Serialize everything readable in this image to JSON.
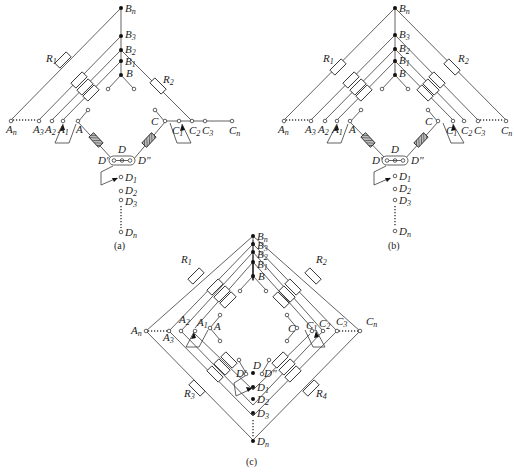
{
  "diagram": {
    "panels": [
      {
        "id": "a",
        "caption": "(a)",
        "top_nodes": [
          "Bn",
          "B3",
          "B2",
          "B1",
          "B"
        ],
        "left_terminals": [
          "An",
          "A3",
          "A2",
          "A1",
          "A"
        ],
        "right_terminals": [
          "C",
          "C1",
          "C2",
          "C3",
          "Cn"
        ],
        "bottom_terminals": [
          "D1",
          "D2",
          "D3",
          "Dn"
        ],
        "resistors": [
          "R1",
          "R2"
        ],
        "selector_labels": {
          "center": "D",
          "left": "D'",
          "right": "D\""
        }
      },
      {
        "id": "b",
        "caption": "(b)",
        "top_nodes": [
          "Bn",
          "B3",
          "B2",
          "B1",
          "B"
        ],
        "left_terminals": [
          "An",
          "A3",
          "A2",
          "A1",
          "A"
        ],
        "right_terminals": [
          "C",
          "C1",
          "C2",
          "C3",
          "Cn"
        ],
        "bottom_terminals": [
          "D1",
          "D2",
          "D3",
          "Dn"
        ],
        "resistors": [
          "R1",
          "R2"
        ],
        "selector_labels": {
          "center": "D",
          "left": "D'",
          "right": "D\""
        }
      },
      {
        "id": "c",
        "caption": "(c)",
        "top_nodes": [
          "Bn",
          "B3",
          "B2",
          "B1",
          "B"
        ],
        "left_terminals": [
          "An",
          "A3",
          "A2",
          "A1",
          "A"
        ],
        "right_terminals": [
          "C",
          "C1",
          "C2",
          "C3",
          "Cn"
        ],
        "bottom_nodes": [
          "D",
          "D1",
          "D2",
          "D3",
          "Dn"
        ],
        "resistors": [
          "R1",
          "R2",
          "R3",
          "R4"
        ],
        "selector_labels": {
          "center": "D",
          "left": "D'",
          "right": "D\""
        }
      }
    ],
    "labels": {
      "Bn": "B",
      "Bn_sub": "n",
      "B3": "B",
      "B3_sub": "3",
      "B2": "B",
      "B2_sub": "2",
      "B1": "B",
      "B1_sub": "1",
      "B": "B",
      "An": "A",
      "An_sub": "n",
      "A3": "A",
      "A3_sub": "3",
      "A2": "A",
      "A2_sub": "2",
      "A1": "A",
      "A1_sub": "1",
      "A": "A",
      "C": "C",
      "C1": "C",
      "C1_sub": "1",
      "C2": "C",
      "C2_sub": "2",
      "C3": "C",
      "C3_sub": "3",
      "Cn": "C",
      "Cn_sub": "n",
      "D": "D",
      "Dp": "D'",
      "Dpp": "D\"",
      "D1": "D",
      "D1_sub": "1",
      "D2": "D",
      "D2_sub": "2",
      "D3": "D",
      "D3_sub": "3",
      "Dn": "D",
      "Dn_sub": "n",
      "R1": "R",
      "R1_sub": "1",
      "R2": "R",
      "R2_sub": "2",
      "R3": "R",
      "R3_sub": "3",
      "R4": "R",
      "R4_sub": "4"
    },
    "captions": {
      "a": "(a)",
      "b": "(b)",
      "c": "(c)"
    }
  }
}
